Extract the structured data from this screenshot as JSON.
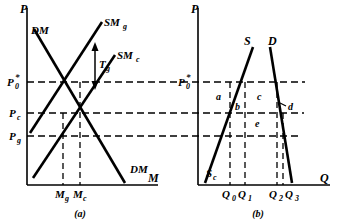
{
  "figure": {
    "caption_a": "(a)",
    "caption_b": "(b)",
    "panel_a": {
      "axis_y_label": "P",
      "axis_x_label": "M",
      "curves": [
        {
          "id": "dm",
          "label": "DM",
          "note": "downward sloping domestic demand for money"
        },
        {
          "id": "dm2",
          "label": "DM",
          "note": "second DM label near x-axis"
        },
        {
          "id": "smg",
          "label": "SMg",
          "label_main": "SM",
          "label_sub": "g"
        },
        {
          "id": "smc",
          "label": "SMc",
          "label_main": "SM",
          "label_sub": "c"
        }
      ],
      "tax_wedge": {
        "label_main": "T",
        "label_sub": "g"
      },
      "price_ticks": [
        {
          "id": "p0",
          "main": "P",
          "sub": "0",
          "star": "*",
          "value_y": 82
        },
        {
          "id": "pc",
          "main": "P",
          "sub": "c",
          "value_y": 113
        },
        {
          "id": "pg",
          "main": "P",
          "sub": "g",
          "value_y": 136
        }
      ],
      "quantity_ticks": [
        {
          "id": "mg",
          "main": "M",
          "sub": "g",
          "value_x": 63
        },
        {
          "id": "mc",
          "main": "M",
          "sub": "c",
          "value_x": 80
        }
      ]
    },
    "panel_b": {
      "axis_y_label": "P",
      "axis_x_label": "Q",
      "curves": [
        {
          "id": "s",
          "label": "S"
        },
        {
          "id": "d",
          "label": "D"
        },
        {
          "id": "sc",
          "main": "S",
          "sub": "c"
        }
      ],
      "price_ticks": [
        {
          "id": "p0b",
          "main": "P",
          "sub": "0",
          "star": "*",
          "value_y": 82
        }
      ],
      "quantity_ticks": [
        {
          "id": "q0",
          "main": "Q",
          "sub": "0",
          "value_x": 230
        },
        {
          "id": "q1",
          "main": "Q",
          "sub": "1",
          "value_x": 245
        },
        {
          "id": "q2",
          "main": "Q",
          "sub": "2",
          "value_x": 277
        },
        {
          "id": "q3",
          "main": "Q",
          "sub": "3",
          "value_x": 285
        }
      ],
      "areas": [
        {
          "id": "a",
          "label": "a",
          "x": 216,
          "y": 97
        },
        {
          "id": "b",
          "label": "b",
          "x": 238,
          "y": 108
        },
        {
          "id": "c",
          "label": "c",
          "x": 259,
          "y": 97
        },
        {
          "id": "d",
          "label": "d",
          "x": 288,
          "y": 107
        },
        {
          "id": "e",
          "label": "e",
          "x": 257,
          "y": 124
        }
      ]
    },
    "colors": {
      "ink": "#000000",
      "background": "#ffffff"
    }
  }
}
